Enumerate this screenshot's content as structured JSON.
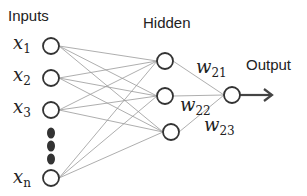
{
  "labels": {
    "inputs": "Inputs",
    "hidden": "Hidden",
    "output": "Output"
  },
  "inputs": [
    {
      "var": "x",
      "sub": "1",
      "cx": 51,
      "cy": 46
    },
    {
      "var": "x",
      "sub": "2",
      "cx": 51,
      "cy": 78
    },
    {
      "var": "x",
      "sub": "3",
      "cx": 51,
      "cy": 110
    },
    {
      "var": "x",
      "sub": "n",
      "cx": 51,
      "cy": 178
    }
  ],
  "ellipsis_dots": [
    {
      "cx": 51,
      "cy": 133
    },
    {
      "cx": 51,
      "cy": 146
    },
    {
      "cx": 51,
      "cy": 159
    }
  ],
  "hidden": [
    {
      "cx": 165,
      "cy": 61
    },
    {
      "cx": 165,
      "cy": 96
    },
    {
      "cx": 171,
      "cy": 132
    }
  ],
  "output_node": {
    "cx": 232,
    "cy": 95
  },
  "weights": [
    {
      "var": "w",
      "sub": "21"
    },
    {
      "var": "w",
      "sub": "22"
    },
    {
      "var": "w",
      "sub": "23"
    }
  ],
  "colors": {
    "node_stroke": "#333333",
    "edge": "#999999",
    "arrow": "#444444",
    "text": "#222222"
  }
}
